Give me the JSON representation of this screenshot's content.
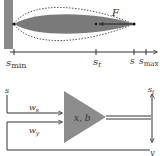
{
  "colors": {
    "wall": "#8a8a8a",
    "leaf": "#7a7a7a",
    "triangle": "#8c8c8c",
    "line": "#333333",
    "dotted": "#555555",
    "text": "#333333"
  },
  "top_diagram": {
    "force_label": "F",
    "axis": {
      "ticks": [
        {
          "base": "s",
          "sub": "min",
          "x": 14
        },
        {
          "base": "s",
          "sub": "t",
          "x": 96
        },
        {
          "base": "s",
          "sub": "",
          "x": 134
        }
      ],
      "end_label": {
        "base": "s",
        "sub": "max"
      }
    }
  },
  "bottom_diagram": {
    "input_label": "s",
    "weight_s": {
      "base": "w",
      "sub": "s"
    },
    "weight_y": {
      "base": "w",
      "sub": "y"
    },
    "neuron_label": "x, b",
    "output_top": {
      "base": "s",
      "sub": "t"
    },
    "output_bottom": "y"
  }
}
